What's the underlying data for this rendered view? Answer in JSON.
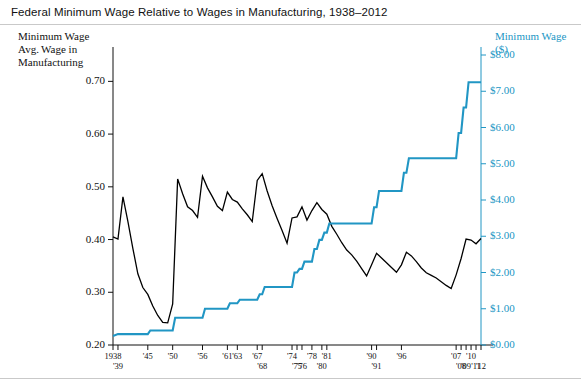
{
  "chart_data": {
    "type": "line",
    "title": "Federal Minimum Wage Relative to Wages in Manufacturing, 1938–2012",
    "xlabel": "",
    "ylabel": "Minimum Wage\nAvg. Wage in\nManufacturing",
    "y2label": "Minimum Wage\n($)",
    "xlim": [
      1938,
      2012
    ],
    "ylim": [
      0.2,
      0.75
    ],
    "y2lim": [
      0.0,
      8.0
    ],
    "grid": false,
    "legend": "none",
    "y_ticks": [
      "0.20",
      "0.30",
      "0.40",
      "0.50",
      "0.60",
      "0.70"
    ],
    "y_tick_values": [
      0.2,
      0.3,
      0.4,
      0.5,
      0.6,
      0.7
    ],
    "y2_ticks": [
      "$0.00",
      "$1.00",
      "$2.00",
      "$3.00",
      "$4.00",
      "$5.00",
      "$6.00",
      "$7.00",
      "$8.00"
    ],
    "y2_tick_values": [
      0,
      1,
      2,
      3,
      4,
      5,
      6,
      7,
      8
    ],
    "x_tick_labels_upper": [
      "1938",
      "'45",
      "'50",
      "'56",
      "'61",
      "'63",
      "'67",
      "'74",
      "'78",
      "'81",
      "'90",
      "'96",
      "'07",
      "'10"
    ],
    "x_tick_labels_lower": [
      "'39",
      "'68",
      "'75",
      "'76",
      "'80",
      "'91",
      "'08",
      "'09",
      "'11",
      "'12"
    ],
    "series": [
      {
        "name": "Minimum Wage / Avg. Wage in Manufacturing",
        "color": "#000000",
        "axis": "left",
        "points": [
          [
            1938,
            0.405
          ],
          [
            1939,
            0.401
          ],
          [
            1940,
            0.481
          ],
          [
            1941,
            0.434
          ],
          [
            1942,
            0.383
          ],
          [
            1943,
            0.335
          ],
          [
            1944,
            0.309
          ],
          [
            1945,
            0.296
          ],
          [
            1946,
            0.274
          ],
          [
            1947,
            0.256
          ],
          [
            1948,
            0.243
          ],
          [
            1949,
            0.242
          ],
          [
            1950,
            0.278
          ],
          [
            1951,
            0.515
          ],
          [
            1952,
            0.487
          ],
          [
            1953,
            0.462
          ],
          [
            1954,
            0.455
          ],
          [
            1955,
            0.442
          ],
          [
            1956,
            0.52
          ],
          [
            1957,
            0.498
          ],
          [
            1958,
            0.481
          ],
          [
            1959,
            0.463
          ],
          [
            1960,
            0.455
          ],
          [
            1961,
            0.49
          ],
          [
            1962,
            0.476
          ],
          [
            1963,
            0.471
          ],
          [
            1964,
            0.458
          ],
          [
            1965,
            0.447
          ],
          [
            1966,
            0.434
          ],
          [
            1967,
            0.512
          ],
          [
            1968,
            0.525
          ],
          [
            1969,
            0.492
          ],
          [
            1970,
            0.464
          ],
          [
            1971,
            0.44
          ],
          [
            1972,
            0.417
          ],
          [
            1973,
            0.393
          ],
          [
            1974,
            0.441
          ],
          [
            1975,
            0.443
          ],
          [
            1976,
            0.462
          ],
          [
            1977,
            0.437
          ],
          [
            1978,
            0.455
          ],
          [
            1979,
            0.47
          ],
          [
            1980,
            0.457
          ],
          [
            1981,
            0.448
          ],
          [
            1982,
            0.425
          ],
          [
            1983,
            0.41
          ],
          [
            1984,
            0.394
          ],
          [
            1985,
            0.38
          ],
          [
            1986,
            0.371
          ],
          [
            1987,
            0.359
          ],
          [
            1988,
            0.345
          ],
          [
            1989,
            0.331
          ],
          [
            1990,
            0.352
          ],
          [
            1991,
            0.374
          ],
          [
            1992,
            0.365
          ],
          [
            1993,
            0.356
          ],
          [
            1994,
            0.347
          ],
          [
            1995,
            0.338
          ],
          [
            1996,
            0.352
          ],
          [
            1997,
            0.376
          ],
          [
            1998,
            0.369
          ],
          [
            1999,
            0.358
          ],
          [
            2000,
            0.346
          ],
          [
            2001,
            0.337
          ],
          [
            2002,
            0.332
          ],
          [
            2003,
            0.327
          ],
          [
            2004,
            0.32
          ],
          [
            2005,
            0.313
          ],
          [
            2006,
            0.307
          ],
          [
            2007,
            0.333
          ],
          [
            2008,
            0.364
          ],
          [
            2009,
            0.401
          ],
          [
            2010,
            0.399
          ],
          [
            2011,
            0.392
          ],
          [
            2012,
            0.402
          ]
        ]
      },
      {
        "name": "Minimum Wage ($)",
        "color": "#2196c4",
        "axis": "right",
        "points": [
          [
            1938,
            0.25
          ],
          [
            1939,
            0.3
          ],
          [
            1945,
            0.3
          ],
          [
            1945.5,
            0.4
          ],
          [
            1950,
            0.4
          ],
          [
            1950.5,
            0.75
          ],
          [
            1956,
            0.75
          ],
          [
            1956.5,
            1.0
          ],
          [
            1961,
            1.0
          ],
          [
            1961.5,
            1.15
          ],
          [
            1963,
            1.15
          ],
          [
            1963.5,
            1.25
          ],
          [
            1967,
            1.25
          ],
          [
            1967.5,
            1.4
          ],
          [
            1968,
            1.4
          ],
          [
            1968.5,
            1.6
          ],
          [
            1974,
            1.6
          ],
          [
            1974.5,
            2.0
          ],
          [
            1975,
            2.0
          ],
          [
            1975.5,
            2.1
          ],
          [
            1976,
            2.1
          ],
          [
            1976.5,
            2.3
          ],
          [
            1978,
            2.3
          ],
          [
            1978.5,
            2.65
          ],
          [
            1979,
            2.65
          ],
          [
            1979.5,
            2.9
          ],
          [
            1980,
            2.9
          ],
          [
            1980.5,
            3.1
          ],
          [
            1981,
            3.1
          ],
          [
            1981.5,
            3.35
          ],
          [
            1990,
            3.35
          ],
          [
            1990.5,
            3.8
          ],
          [
            1991,
            3.8
          ],
          [
            1991.5,
            4.25
          ],
          [
            1996,
            4.25
          ],
          [
            1996.5,
            4.75
          ],
          [
            1997,
            4.75
          ],
          [
            1997.5,
            5.15
          ],
          [
            2007,
            5.15
          ],
          [
            2007.5,
            5.85
          ],
          [
            2008,
            5.85
          ],
          [
            2008.5,
            6.55
          ],
          [
            2009,
            6.55
          ],
          [
            2009.5,
            7.25
          ],
          [
            2012,
            7.25
          ]
        ]
      }
    ]
  }
}
